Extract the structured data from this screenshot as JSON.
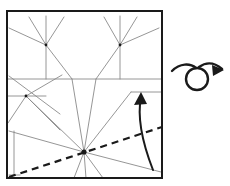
{
  "figure": {
    "kind": "origami-crease-pattern-step",
    "background_color": "#ffffff"
  },
  "style": {
    "paper_edge_color": "#1a1a1a",
    "paper_edge_width": 2,
    "crease_color": "#8a8a8a",
    "crease_width": 0.9,
    "valley_dashed_color": "#1a1a1a",
    "valley_dashed_width": 2.2,
    "valley_dash_pattern": "7,5",
    "arrow_color": "#1a1a1a",
    "arrow_width": 2,
    "turnover_color": "#1a1a1a",
    "turnover_width": 2.4
  },
  "paper": {
    "label": "square sheet",
    "x": 7,
    "y": 11,
    "width": 155,
    "height": 167
  },
  "vertices": [
    {
      "name": "top-left-vertex",
      "x": 46,
      "y": 45
    },
    {
      "name": "top-right-vertex",
      "x": 120,
      "y": 45
    },
    {
      "name": "left-mid-vertex",
      "x": 26,
      "y": 96
    },
    {
      "name": "bottom-hub-vertex",
      "x": 84,
      "y": 152
    }
  ],
  "creases": [
    {
      "name": "horizontal-mid-crease",
      "x1": 7,
      "y1": 79,
      "x2": 162,
      "y2": 79
    },
    {
      "name": "left-short-horizontal-crease",
      "x1": 7,
      "y1": 96,
      "x2": 46,
      "y2": 96
    },
    {
      "name": "right-short-horizontal-crease",
      "x1": 131,
      "y1": 92,
      "x2": 162,
      "y2": 92
    },
    {
      "name": "tl-spoke-vertical-up",
      "x1": 46,
      "y1": 45,
      "x2": 46,
      "y2": 16
    },
    {
      "name": "tl-spoke-upleft",
      "x1": 46,
      "y1": 45,
      "x2": 29,
      "y2": 17
    },
    {
      "name": "tl-spoke-upright",
      "x1": 46,
      "y1": 45,
      "x2": 64,
      "y2": 17
    },
    {
      "name": "tl-spoke-left",
      "x1": 46,
      "y1": 45,
      "x2": 9,
      "y2": 28
    },
    {
      "name": "tl-spoke-vertical-down",
      "x1": 46,
      "y1": 45,
      "x2": 46,
      "y2": 79
    },
    {
      "name": "tl-spoke-downright",
      "x1": 46,
      "y1": 45,
      "x2": 72,
      "y2": 79
    },
    {
      "name": "tr-spoke-vertical-up",
      "x1": 120,
      "y1": 45,
      "x2": 120,
      "y2": 16
    },
    {
      "name": "tr-spoke-upleft",
      "x1": 120,
      "y1": 45,
      "x2": 104,
      "y2": 17
    },
    {
      "name": "tr-spoke-upright",
      "x1": 120,
      "y1": 45,
      "x2": 137,
      "y2": 17
    },
    {
      "name": "tr-spoke-right",
      "x1": 120,
      "y1": 45,
      "x2": 159,
      "y2": 28
    },
    {
      "name": "tr-spoke-vertical-down",
      "x1": 120,
      "y1": 45,
      "x2": 120,
      "y2": 79
    },
    {
      "name": "tr-spoke-downleft",
      "x1": 120,
      "y1": 45,
      "x2": 96,
      "y2": 79
    },
    {
      "name": "left-diagonal-down-from-edge",
      "x1": 9,
      "y1": 76,
      "x2": 60,
      "y2": 114
    },
    {
      "name": "left-vertex-spoke-upright",
      "x1": 26,
      "y1": 96,
      "x2": 62,
      "y2": 75
    },
    {
      "name": "left-vertex-spoke-downleft",
      "x1": 26,
      "y1": 96,
      "x2": 8,
      "y2": 123
    },
    {
      "name": "left-vertex-spoke-downright",
      "x1": 26,
      "y1": 96,
      "x2": 60,
      "y2": 130
    },
    {
      "name": "hub-spoke-to-left-vertex",
      "x1": 84,
      "y1": 152,
      "x2": 26,
      "y2": 96
    },
    {
      "name": "hub-spoke-up-left-steep",
      "x1": 84,
      "y1": 152,
      "x2": 72,
      "y2": 79
    },
    {
      "name": "hub-spoke-up-right-steep",
      "x1": 84,
      "y1": 152,
      "x2": 96,
      "y2": 79
    },
    {
      "name": "hub-spoke-up-right-shallow",
      "x1": 84,
      "y1": 152,
      "x2": 131,
      "y2": 92
    },
    {
      "name": "hub-spoke-left-to-edge",
      "x1": 84,
      "y1": 152,
      "x2": 9,
      "y2": 131
    },
    {
      "name": "hub-spoke-right-to-edge",
      "x1": 84,
      "y1": 152,
      "x2": 161,
      "y2": 172
    },
    {
      "name": "hub-spoke-down-left",
      "x1": 84,
      "y1": 152,
      "x2": 74,
      "y2": 178
    },
    {
      "name": "hub-spoke-down",
      "x1": 84,
      "y1": 152,
      "x2": 86,
      "y2": 178
    },
    {
      "name": "hub-spoke-down-right",
      "x1": 84,
      "y1": 152,
      "x2": 103,
      "y2": 178
    },
    {
      "name": "left-edge-vertical-inner",
      "x1": 14,
      "y1": 131,
      "x2": 14,
      "y2": 175
    },
    {
      "name": "left-edge-cap",
      "x1": 9,
      "y1": 175,
      "x2": 20,
      "y2": 175
    }
  ],
  "valley_fold": {
    "name": "valley-fold-dashed-line",
    "x1": 9,
    "y1": 177,
    "x2": 162,
    "y2": 127
  },
  "fold_arrow": {
    "name": "curved-fold-arrow",
    "path": "M 153 170 C 146 152, 136 122, 141 97",
    "head_tip_x": 141,
    "head_tip_y": 92,
    "head_left_x": 134,
    "head_left_y": 105,
    "head_right_x": 147,
    "head_right_y": 104
  },
  "turnover_symbol": {
    "name": "turn-over-symbol",
    "loop_cx": 197,
    "loop_cy": 79,
    "loop_rx": 11,
    "loop_ry": 11,
    "tail_path": "M 172 71 C 180 63, 190 63, 196 68",
    "head_path": "M 199 67 C 206 62, 214 62, 222 69",
    "head_tip_x": 224,
    "head_tip_y": 70,
    "head_barb1_x": 212,
    "head_barb1_y": 65,
    "head_barb2_x": 213,
    "head_barb2_y": 76
  }
}
